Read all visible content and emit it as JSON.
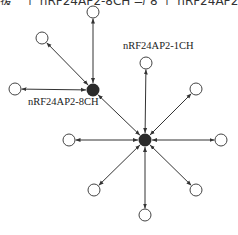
{
  "caption_fragment": "援一个 nRF24AP2-8CH 与 8 个 nRF24AP2-1CH 节点通信的",
  "labels": {
    "hub_8ch": "nRF24AP2-8CH",
    "hub_1ch": "nRF24AP2-1CH"
  },
  "colors": {
    "line": "#333333",
    "hub_fill": "#2a2a2a",
    "node_stroke": "#444444"
  },
  "hubs": [
    {
      "id": "hub-8ch",
      "x": 93,
      "y": 90,
      "label": "nRF24AP2-8CH"
    },
    {
      "id": "hub-1ch",
      "x": 145,
      "y": 140,
      "label": "nRF24AP2-1CH"
    }
  ],
  "nodes": [
    {
      "id": "n-top-a",
      "x": 93,
      "y": 12,
      "hub": "hub-8ch"
    },
    {
      "id": "n-upleft-a",
      "x": 42,
      "y": 38,
      "hub": "hub-8ch"
    },
    {
      "id": "n-left-a",
      "x": 15,
      "y": 89,
      "hub": "hub-8ch"
    },
    {
      "id": "n-top-b",
      "x": 146,
      "y": 63,
      "hub": "hub-1ch"
    },
    {
      "id": "n-upright-b",
      "x": 196,
      "y": 89,
      "hub": "hub-1ch"
    },
    {
      "id": "n-right-b",
      "x": 221,
      "y": 140,
      "hub": "hub-1ch"
    },
    {
      "id": "n-left-b",
      "x": 69,
      "y": 140,
      "hub": "hub-1ch"
    },
    {
      "id": "n-lowleft-b",
      "x": 94,
      "y": 190,
      "hub": "hub-1ch"
    },
    {
      "id": "n-bottom-b",
      "x": 145,
      "y": 215,
      "hub": "hub-1ch"
    },
    {
      "id": "n-lowright-b",
      "x": 196,
      "y": 190,
      "hub": "hub-1ch"
    }
  ],
  "links": [
    [
      "hub-8ch",
      "hub-1ch"
    ]
  ]
}
